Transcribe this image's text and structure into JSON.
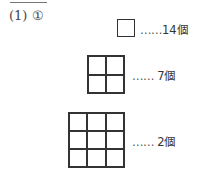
{
  "problem": {
    "label": "(1) ①"
  },
  "items": [
    {
      "grid_size": 1,
      "dots": "……",
      "count": "14個"
    },
    {
      "grid_size": 2,
      "dots": "…… ",
      "count": "7個"
    },
    {
      "grid_size": 3,
      "dots": "…… ",
      "count": "2個"
    }
  ],
  "colors": {
    "line": "#333333",
    "text": "#2a2a2a"
  }
}
